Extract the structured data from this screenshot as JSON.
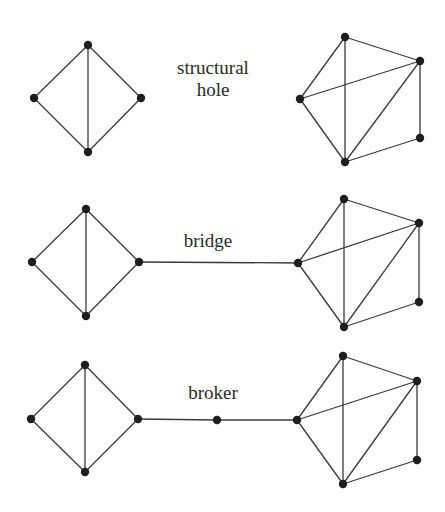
{
  "diagram": {
    "labels": {
      "structural_hole": "structural\nhole",
      "structural_hole_line1": "structural",
      "structural_hole_line2": "hole",
      "bridge": "bridge",
      "broker": "broker"
    },
    "colors": {
      "edge": "#3a3a3a",
      "node": "#1e1e1e",
      "background": "#ffffff"
    },
    "panels": [
      {
        "name": "structural-hole",
        "nodes": [
          {
            "id": "a1",
            "x": 88,
            "y": 45
          },
          {
            "id": "a2",
            "x": 34,
            "y": 98
          },
          {
            "id": "a3",
            "x": 141,
            "y": 98
          },
          {
            "id": "a4",
            "x": 88,
            "y": 152
          },
          {
            "id": "b1",
            "x": 345,
            "y": 37
          },
          {
            "id": "b2",
            "x": 420,
            "y": 61
          },
          {
            "id": "b3",
            "x": 300,
            "y": 99
          },
          {
            "id": "b4",
            "x": 420,
            "y": 138
          },
          {
            "id": "b5",
            "x": 345,
            "y": 162
          }
        ],
        "edges": [
          [
            "a1",
            "a2"
          ],
          [
            "a1",
            "a3"
          ],
          [
            "a1",
            "a4"
          ],
          [
            "a2",
            "a4"
          ],
          [
            "a3",
            "a4"
          ],
          [
            "b1",
            "b2"
          ],
          [
            "b1",
            "b3"
          ],
          [
            "b1",
            "b5"
          ],
          [
            "b3",
            "b2"
          ],
          [
            "b3",
            "b5"
          ],
          [
            "b5",
            "b2"
          ],
          [
            "b2",
            "b4"
          ],
          [
            "b5",
            "b4"
          ]
        ]
      },
      {
        "name": "bridge",
        "nodes": [
          {
            "id": "a1",
            "x": 86,
            "y": 209
          },
          {
            "id": "a2",
            "x": 32,
            "y": 262
          },
          {
            "id": "a3",
            "x": 139,
            "y": 262
          },
          {
            "id": "a4",
            "x": 86,
            "y": 316
          },
          {
            "id": "b1",
            "x": 344,
            "y": 199
          },
          {
            "id": "b2",
            "x": 419,
            "y": 223
          },
          {
            "id": "b3",
            "x": 298,
            "y": 263
          },
          {
            "id": "b4",
            "x": 419,
            "y": 302
          },
          {
            "id": "b5",
            "x": 344,
            "y": 327
          }
        ],
        "edges": [
          [
            "a1",
            "a2"
          ],
          [
            "a1",
            "a3"
          ],
          [
            "a1",
            "a4"
          ],
          [
            "a2",
            "a4"
          ],
          [
            "a3",
            "a4"
          ],
          [
            "b1",
            "b2"
          ],
          [
            "b1",
            "b3"
          ],
          [
            "b1",
            "b5"
          ],
          [
            "b3",
            "b2"
          ],
          [
            "b3",
            "b5"
          ],
          [
            "b5",
            "b2"
          ],
          [
            "b2",
            "b4"
          ],
          [
            "b5",
            "b4"
          ],
          [
            "a3",
            "b3"
          ]
        ]
      },
      {
        "name": "broker",
        "nodes": [
          {
            "id": "a1",
            "x": 85,
            "y": 365
          },
          {
            "id": "a2",
            "x": 31,
            "y": 419
          },
          {
            "id": "a3",
            "x": 138,
            "y": 419
          },
          {
            "id": "a4",
            "x": 85,
            "y": 472
          },
          {
            "id": "m",
            "x": 217,
            "y": 420
          },
          {
            "id": "b1",
            "x": 343,
            "y": 356
          },
          {
            "id": "b2",
            "x": 417,
            "y": 381
          },
          {
            "id": "b3",
            "x": 297,
            "y": 420
          },
          {
            "id": "b4",
            "x": 417,
            "y": 460
          },
          {
            "id": "b5",
            "x": 343,
            "y": 484
          }
        ],
        "edges": [
          [
            "a1",
            "a2"
          ],
          [
            "a1",
            "a3"
          ],
          [
            "a1",
            "a4"
          ],
          [
            "a2",
            "a4"
          ],
          [
            "a3",
            "a4"
          ],
          [
            "b1",
            "b2"
          ],
          [
            "b1",
            "b3"
          ],
          [
            "b1",
            "b5"
          ],
          [
            "b3",
            "b2"
          ],
          [
            "b3",
            "b5"
          ],
          [
            "b5",
            "b2"
          ],
          [
            "b2",
            "b4"
          ],
          [
            "b5",
            "b4"
          ],
          [
            "a3",
            "m"
          ],
          [
            "m",
            "b3"
          ]
        ]
      }
    ]
  }
}
